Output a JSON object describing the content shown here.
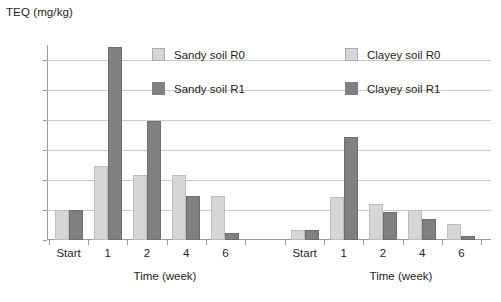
{
  "chart_data": {
    "type": "bar",
    "title": "",
    "ylabel": "TEQ (mg/kg)",
    "xlabel": "Time (week)",
    "ylim": [
      0,
      65
    ],
    "yticks": [
      0,
      10,
      20,
      30,
      40,
      50,
      60
    ],
    "grid": true,
    "legend_position": "top-center",
    "categories": [
      "Start",
      "1",
      "2",
      "4",
      "6"
    ],
    "panels": [
      {
        "name": "Sandy soil",
        "xlabel": "Time (week)",
        "categories": [
          "Start",
          "1",
          "2",
          "4",
          "6"
        ],
        "series": [
          {
            "name": "Sandy soil R0",
            "color": "#d6d6d6",
            "values": [
              10.0,
              24.8,
              21.8,
              21.8,
              14.7
            ]
          },
          {
            "name": "Sandy soil R1",
            "color": "#808080",
            "values": [
              10.0,
              64.5,
              39.7,
              14.8,
              2.3
            ]
          }
        ]
      },
      {
        "name": "Clayey soil",
        "xlabel": "Time (week)",
        "categories": [
          "Start",
          "1",
          "2",
          "4",
          "6"
        ],
        "series": [
          {
            "name": "Clayey soil R0",
            "color": "#d6d6d6",
            "values": [
              3.5,
              14.5,
              12.0,
              10.0,
              5.5
            ]
          },
          {
            "name": "Clayey soil R1",
            "color": "#808080",
            "values": [
              3.5,
              34.5,
              9.5,
              7.0,
              1.5
            ]
          }
        ]
      }
    ],
    "legend": [
      {
        "label": "Sandy soil R0",
        "color": "#d6d6d6"
      },
      {
        "label": "Sandy soil R1",
        "color": "#808080"
      },
      {
        "label": "Clayey soil R0",
        "color": "#d6d6d6"
      },
      {
        "label": "Clayey soil R1",
        "color": "#808080"
      }
    ],
    "colors": {
      "r0": "#d6d6d6",
      "r1": "#808080",
      "grid": "#c9c9c9",
      "axis": "#9a9a9a",
      "text": "#231f20"
    }
  }
}
